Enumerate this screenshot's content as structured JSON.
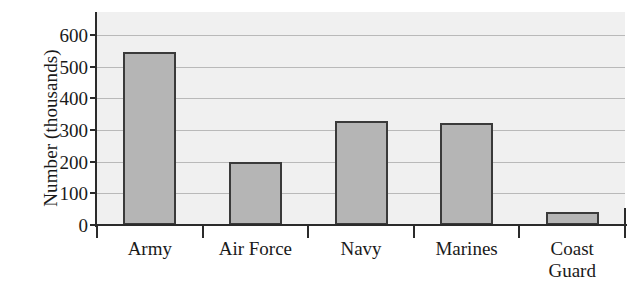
{
  "chart_data": {
    "type": "bar",
    "title": "",
    "xlabel": "",
    "ylabel": "Number (thousands)",
    "categories": [
      "Army",
      "Air Force",
      "Navy",
      "Marines",
      "Coast\nGuard"
    ],
    "values": [
      545,
      200,
      330,
      322,
      40
    ],
    "ylim": [
      0,
      600
    ],
    "yticks": [
      0,
      100,
      200,
      300,
      400,
      500,
      600
    ],
    "ytick_labels": [
      "0",
      "100",
      "200",
      "300",
      "400",
      "500",
      "600"
    ],
    "grid": true,
    "legend": "none"
  },
  "style": {
    "bar_fill": "#b5b5b5",
    "bar_edge": "#3a3a3a",
    "plot_background": "#f0f0f0",
    "page_background": "#ffffff",
    "gridline_color": "#b9b9b9",
    "axis_color": "#2b2b2b",
    "text_color": "#1a1a1a"
  }
}
